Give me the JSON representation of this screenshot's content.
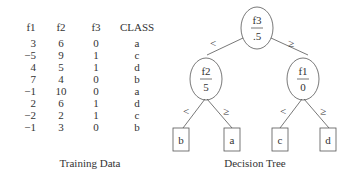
{
  "training_data": {
    "columns": [
      "f1",
      "f2",
      "f3",
      "CLASS"
    ],
    "rows": [
      [
        "3",
        "6",
        "0",
        "a"
      ],
      [
        "−5",
        "9",
        "1",
        "c"
      ],
      [
        "4",
        "5",
        "1",
        "d"
      ],
      [
        "7",
        "4",
        "0",
        "b"
      ],
      [
        "−1",
        "10",
        "0",
        "a"
      ],
      [
        "2",
        "6",
        "1",
        "d"
      ],
      [
        "−2",
        "2",
        "1",
        "c"
      ],
      [
        "−1",
        "3",
        "0",
        "b"
      ]
    ],
    "caption": "Training Data"
  },
  "decision_tree": {
    "caption": "Decision Tree",
    "root": {
      "feature": "f3",
      "threshold": ".5"
    },
    "left": {
      "feature": "f2",
      "threshold": "5"
    },
    "right": {
      "feature": "f1",
      "threshold": "0"
    },
    "edge_less": "<",
    "edge_geq": "≥",
    "leaves": [
      "b",
      "a",
      "c",
      "d"
    ]
  }
}
